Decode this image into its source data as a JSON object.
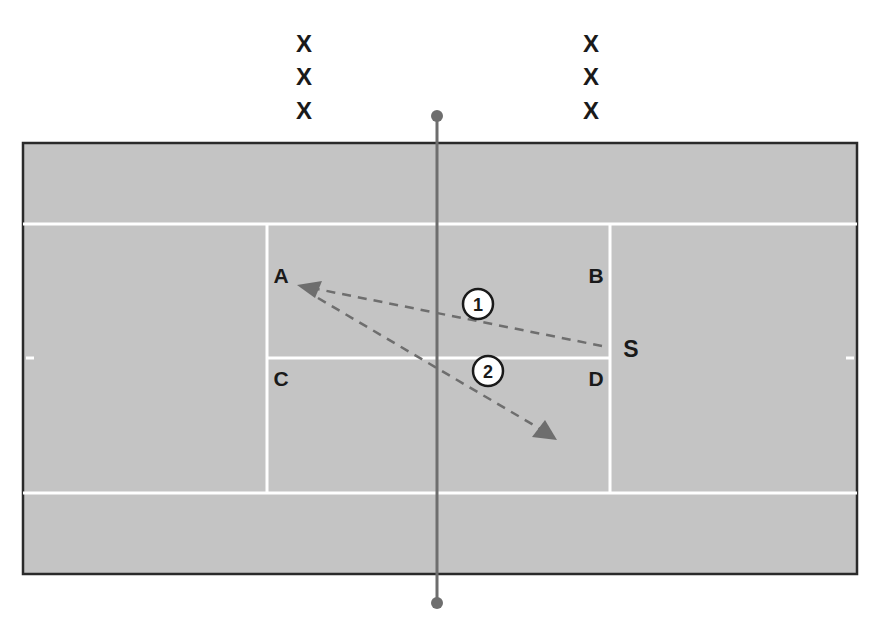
{
  "diagram": {
    "type": "tennis-court-drill",
    "players_top_left": [
      "X",
      "X",
      "X"
    ],
    "players_top_right": [
      "X",
      "X",
      "X"
    ],
    "court_labels": {
      "A": "A",
      "B": "B",
      "C": "C",
      "D": "D",
      "S": "S"
    },
    "shots": [
      {
        "number": "1",
        "from": "S",
        "to": "A"
      },
      {
        "number": "2",
        "from": "A",
        "to": "D-court deep"
      }
    ],
    "colors": {
      "court": "#c4c4c4",
      "lines": "#ffffff",
      "border": "#2a2a2a",
      "net": "#6e6e6e",
      "arrows": "#6e6e6e",
      "text": "#1a1a1a"
    }
  }
}
